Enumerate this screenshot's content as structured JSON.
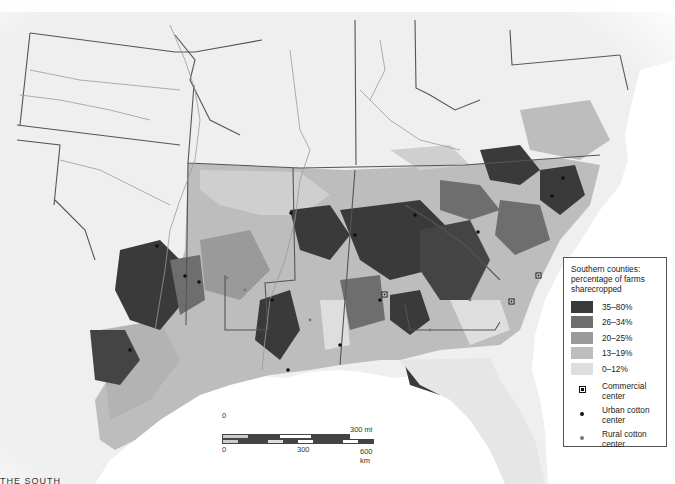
{
  "map": {
    "subject": "Southern United States counties, share of farms sharecropped",
    "colors": {
      "background": "#f2f2f2",
      "water": "#ffffff",
      "state_border": "#555555",
      "river": "#9a9a9a",
      "class_35_80": "#3a3a3a",
      "class_26_34": "#6e6e6e",
      "class_20_25": "#9a9a9a",
      "class_13_19": "#bdbdbd",
      "class_0_12": "#dedede"
    }
  },
  "legend": {
    "title": "Southern counties: percentage of farms sharecropped",
    "classes": [
      {
        "label": "35–80%",
        "color": "#3a3a3a"
      },
      {
        "label": "26–34%",
        "color": "#6e6e6e"
      },
      {
        "label": "20–25%",
        "color": "#9a9a9a"
      },
      {
        "label": "13–19%",
        "color": "#bdbdbd"
      },
      {
        "label": "0–12%",
        "color": "#dedede"
      }
    ],
    "symbols": [
      {
        "icon": "commercial-center-icon",
        "label": "Commercial center"
      },
      {
        "icon": "urban-cotton-center-icon",
        "label": "Urban cotton center"
      },
      {
        "icon": "rural-cotton-center-icon",
        "label": "Rural cotton center"
      }
    ]
  },
  "scale_bar": {
    "mi_start": "0",
    "mi_end": "300 mi",
    "km_start": "0",
    "km_mid": "300",
    "km_end": "600 km"
  },
  "footer": {
    "cutoff_text": "THE SOUTH"
  }
}
